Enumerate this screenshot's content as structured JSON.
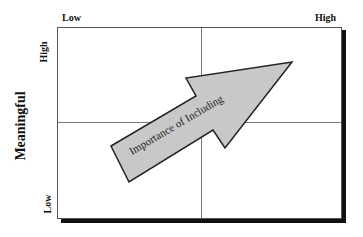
{
  "diagram": {
    "type": "quadrant-matrix",
    "top_axis": {
      "low_label": "Low",
      "high_label": "High"
    },
    "left_axis": {
      "title": "Meaningful",
      "high_label": "High",
      "low_label": "Low"
    },
    "arrow": {
      "label": "Importance of Including",
      "direction": "bottom-left to top-right"
    },
    "quadrants": 4
  },
  "colors": {
    "background": "#ffffff",
    "border": "#555555",
    "divider": "#777777",
    "shadow": "#111111",
    "arrow_fill": "#c8c8c8",
    "arrow_stroke": "#222222",
    "text": "#111111"
  }
}
